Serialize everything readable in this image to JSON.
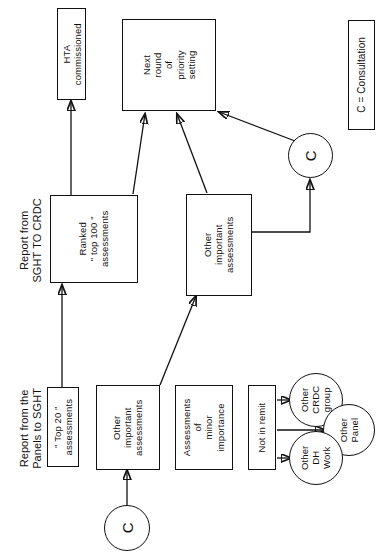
{
  "diagram": {
    "orientation": "rotated-90",
    "legend": {
      "text": "C = Consultation"
    },
    "nodes": {
      "hta_commissioned": "HTA\ncommissioned",
      "next_round": "Next\nround\nof\npriority\nsetting",
      "ranked_top100": "Ranked\n\" top 100 \"\nassessments",
      "other_important_mid": "Other\nimportant\nassessments",
      "top20": "\" Top 20 \"\nassessments",
      "other_important_bottom": "Other\nimportant\nassessments",
      "minor_importance": "Assessments\nof\nminor\nimportance",
      "not_in_remit": "Not in remit",
      "other_crdc_group": "Other\nCRDC\ngroup",
      "other_panel": "Other\nPanel",
      "other_dh_work": "Other\nDH\nWork",
      "consultation_top": "C",
      "consultation_bottom": "C"
    },
    "annotations": {
      "report_sght_crdc": "Report from\nSGHT TO CRDC",
      "report_panels_sght": "Report from the\nPanels to SGHT"
    },
    "colors": {
      "stroke": "#111111",
      "background": "#ffffff"
    }
  }
}
